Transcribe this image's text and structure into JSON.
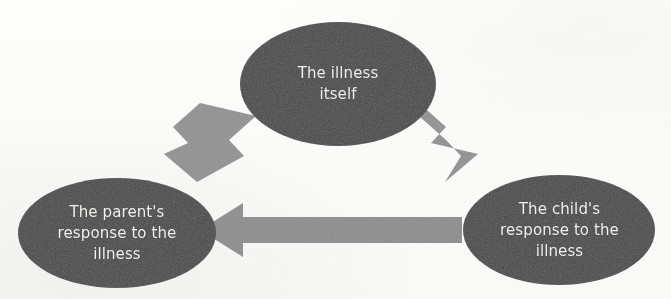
{
  "diagram": {
    "background_color": "#fcfcfb",
    "node_fill_color": "#4a4a4a",
    "node_text_color": "#f2f2f0",
    "arrow_color": "#8f8f8f",
    "nodes": [
      {
        "id": "illness",
        "label": "The illness\nitself",
        "shape": "ellipse",
        "cx": 338,
        "cy": 84,
        "rx": 98,
        "ry": 62
      },
      {
        "id": "parent",
        "label": "The parent's\nresponse to the\nillness",
        "shape": "ellipse",
        "cx": 117,
        "cy": 233,
        "rx": 99,
        "ry": 55
      },
      {
        "id": "child",
        "label": "The child's\nresponse to the\nillness",
        "shape": "ellipse",
        "cx": 559,
        "cy": 230,
        "rx": 96,
        "ry": 55
      }
    ],
    "arrows": [
      {
        "id": "illness-to-parent",
        "from": "illness",
        "to": "parent",
        "direction": "down-left",
        "label": ""
      },
      {
        "id": "illness-to-child",
        "from": "illness",
        "to": "child",
        "direction": "down-right",
        "label": ""
      },
      {
        "id": "child-to-parent",
        "from": "child",
        "to": "parent",
        "direction": "left",
        "label": ""
      }
    ]
  }
}
